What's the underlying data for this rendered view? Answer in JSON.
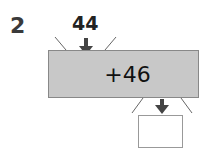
{
  "question": {
    "number": "2",
    "input_value": "44",
    "operation": "+46",
    "answer_box": ""
  },
  "colors": {
    "machine_fill": "#c8c8c8",
    "arrow": "#444444"
  }
}
